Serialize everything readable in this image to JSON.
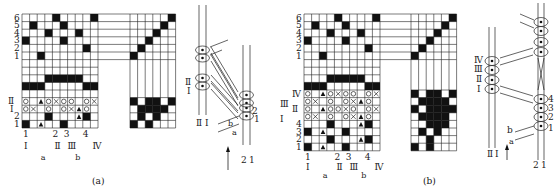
{
  "panels": [
    {
      "id": "a",
      "caption": "(a)",
      "grid": {
        "x": 22,
        "y": 14,
        "cell": 7.7,
        "cols": 10,
        "rows": [
          {
            "label": "6",
            "cells": "0000200002"
          },
          {
            "label": "5",
            "cells": "0200020000"
          },
          {
            "label": "4",
            "cells": "0002000200"
          },
          {
            "label": "3",
            "cells": "2000020000"
          },
          {
            "label": "2",
            "cells": "0000000020"
          },
          {
            "label": "1",
            "cells": "0020000000"
          },
          {
            "label": "",
            "cells": "blank"
          },
          {
            "label": "",
            "cells": "blank"
          },
          {
            "label": "",
            "cells": "0003333300"
          },
          {
            "label": "",
            "cells": "3330000033"
          },
          {
            "label": "",
            "cells": "blank"
          },
          {
            "label": "Ⅱ",
            "cells": "o.t ox o..ox"
          },
          {
            "label": "Ⅰ",
            "cells": "ox o  oxt o."
          },
          {
            "label": "2",
            "cells": "0000200t20"
          },
          {
            "label": "1",
            "cells": "20t0020000"
          }
        ],
        "bottom_numbers": [
          "1",
          "2",
          "3",
          "4"
        ],
        "bottom_roman": [
          "Ⅰ",
          "Ⅱ",
          "Ⅲ",
          "Ⅳ"
        ],
        "bottom_letters": [
          "a",
          "b"
        ]
      },
      "threading": {
        "cols": 6,
        "diagonal_rows": 6,
        "tieup_rows": 4
      },
      "cross_section": {
        "left_labels": [
          "Ⅱ",
          "Ⅰ"
        ],
        "left_bottom": [
          "Ⅱ",
          "Ⅰ"
        ],
        "right_labels": [
          "2",
          "1"
        ],
        "right_bottom": [
          "2",
          "1"
        ],
        "weft_labels": [
          "b",
          "a"
        ]
      }
    },
    {
      "id": "b",
      "caption": "(b)",
      "grid": {
        "rows_labels_numbered": [
          "6",
          "5",
          "4",
          "3",
          "2",
          "1"
        ],
        "rows_labels_roman_left": [
          "Ⅲ",
          "Ⅰ"
        ],
        "rows_labels_roman_right": [
          "Ⅳ",
          "Ⅱ"
        ],
        "rows_labels_bottom": [
          "4",
          "3",
          "2",
          "1"
        ],
        "bottom_numbers": [
          "1",
          "2",
          "3",
          "4"
        ],
        "bottom_roman": [
          "Ⅰ",
          "Ⅱ",
          "Ⅲ",
          "Ⅳ"
        ],
        "bottom_letters": [
          "a",
          "b"
        ]
      },
      "threading": {
        "cols": 6,
        "diagonal_rows": 6,
        "tieup_rows": 8
      },
      "cross_section": {
        "left_labels": [
          "Ⅳ",
          "Ⅲ",
          "Ⅱ",
          "Ⅰ"
        ],
        "left_bottom": [
          "Ⅱ",
          "Ⅰ"
        ],
        "right_labels": [
          "4",
          "3",
          "2",
          "1"
        ],
        "right_bottom": [
          "2",
          "1"
        ],
        "weft_labels": [
          "b",
          "a"
        ]
      }
    }
  ]
}
